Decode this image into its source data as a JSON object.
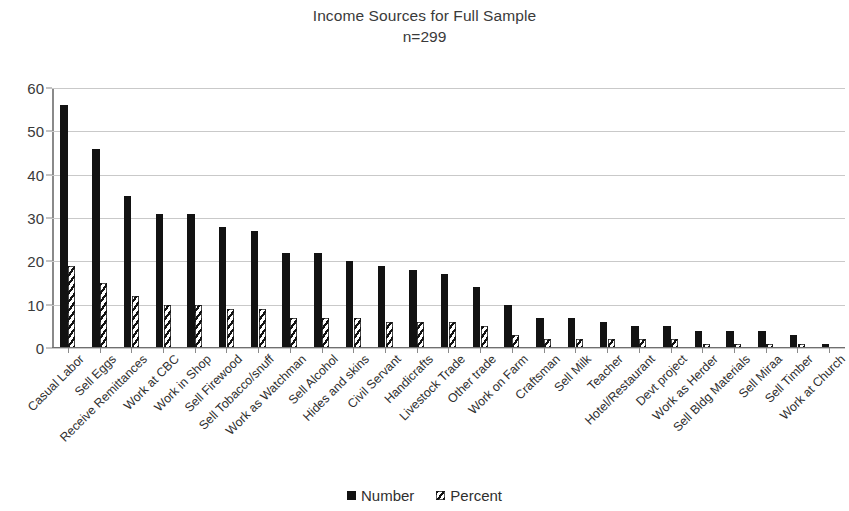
{
  "chart_data": {
    "type": "bar",
    "title": "Income Sources for Full Sample",
    "subtitle": "n=299",
    "xlabel": "",
    "ylabel": "",
    "ylim": [
      0,
      60
    ],
    "ytick_step": 10,
    "yticks": [
      0,
      10,
      20,
      30,
      40,
      50,
      60
    ],
    "ytick_labels": [
      "0",
      "10",
      "20",
      "30",
      "40",
      "50",
      "60"
    ],
    "grid": true,
    "grid_axis": "y",
    "legend_position": "bottom",
    "categories": [
      "Casual Labor",
      "Sell Eggs",
      "Receive Remittances",
      "Work at CBC",
      "Work in Shop",
      "Sell Firewood",
      "Sell Tobacco/snuff",
      "Work as Watchman",
      "Sell Alcohol",
      "Hides and skins",
      "Civil Servant",
      "Handicrafts",
      "Livestock Trade",
      "Other trade",
      "Work on Farm",
      "Craftsman",
      "Sell Milk",
      "Teacher",
      "Hotel/Restaurant",
      "Devt project",
      "Work as Herder",
      "Sell Bldg Materials",
      "Sell Miraa",
      "Sell Timber",
      "Work at Church"
    ],
    "series": [
      {
        "name": "Number",
        "color": "#121212",
        "fill": "solid",
        "values": [
          56,
          46,
          35,
          31,
          31,
          28,
          27,
          22,
          22,
          20,
          19,
          18,
          17,
          14,
          10,
          7,
          7,
          6,
          5,
          5,
          4,
          4,
          4,
          3,
          1
        ]
      },
      {
        "name": "Percent",
        "color": "#121212",
        "fill": "diagonal-hatch",
        "values": [
          19,
          15,
          12,
          10,
          10,
          9,
          9,
          7,
          7,
          7,
          6,
          6,
          6,
          5,
          3,
          2,
          2,
          2,
          2,
          2,
          1,
          1,
          1,
          1,
          0
        ]
      }
    ]
  },
  "legend": {
    "items": [
      {
        "label": "Number",
        "marker": "solid-square-icon"
      },
      {
        "label": "Percent",
        "marker": "hatched-square-icon"
      }
    ]
  }
}
